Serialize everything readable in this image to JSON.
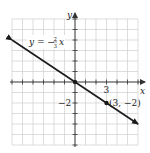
{
  "chart_data": {
    "type": "line",
    "title": "",
    "xlabel": "x",
    "ylabel": "y",
    "xlim": [
      -6,
      6
    ],
    "ylim": [
      -6,
      6
    ],
    "grid": true,
    "series": [
      {
        "name": "y = -2/3 x",
        "equation": "y = -(2/3)x",
        "slope": -0.6667,
        "intercept": 0,
        "x": [
          -6,
          6
        ],
        "y": [
          4,
          -4
        ],
        "arrows": "both"
      }
    ],
    "points": [
      {
        "x": 0,
        "y": 0,
        "label": ""
      },
      {
        "x": 3,
        "y": -2,
        "label": "(3, −2)"
      }
    ],
    "tick_labels": {
      "x": [
        "3"
      ],
      "y": [
        "−2"
      ]
    },
    "annotations": [
      "y = −(2/3)x",
      "(3, −2)"
    ]
  },
  "labels": {
    "x_axis": "x",
    "y_axis": "y",
    "x_tick": "3",
    "y_tick": "−2",
    "point": "(3, −2)",
    "eq_lhs": "y = −",
    "eq_num": "2",
    "eq_den": "3",
    "eq_var": "x"
  },
  "colors": {
    "grid": "#cfcfcf",
    "axis": "#333333",
    "line": "#1a1a1a",
    "background": "#ffffff"
  }
}
